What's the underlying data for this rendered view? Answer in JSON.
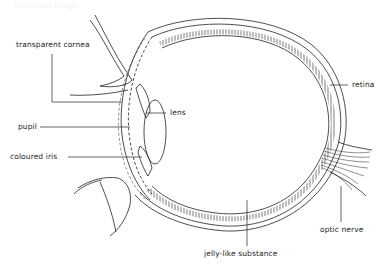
{
  "header": {
    "caption_fragment": "this visual image"
  },
  "diagram": {
    "labels": {
      "cornea": "transparent cornea",
      "pupil": "pupil",
      "iris": "coloured iris",
      "lens": "lens",
      "retina": "retina",
      "optic_nerve": "optic nerve",
      "vitreous": "jelly-like substance"
    },
    "colors": {
      "ink": "#222222",
      "background": "#ffffff"
    }
  }
}
